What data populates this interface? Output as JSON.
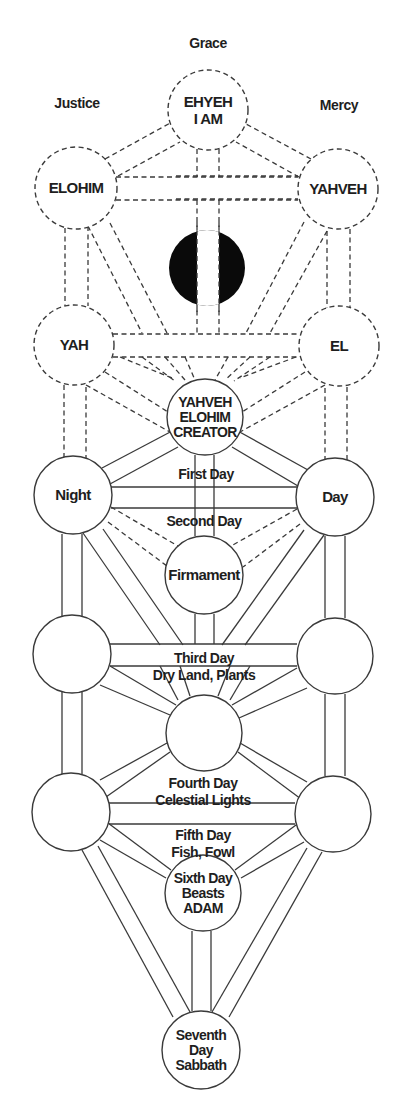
{
  "colors": {
    "background": "#ffffff",
    "stroke": "#3a3a3a",
    "text": "#1e1e1e",
    "daath_fill": "#0a0a0a"
  },
  "pillar_labels": [
    {
      "id": "grace",
      "text": "Grace",
      "x": 208,
      "y": 48
    },
    {
      "id": "justice",
      "text": "Justice",
      "x": 77,
      "y": 108
    },
    {
      "id": "mercy",
      "text": "Mercy",
      "x": 339,
      "y": 110
    }
  ],
  "nodes": [
    {
      "id": "ehyeh",
      "cx": 208,
      "cy": 110,
      "r": 40,
      "dashed": true,
      "lines": [
        "EHYEH",
        "I AM"
      ]
    },
    {
      "id": "elohim",
      "cx": 76,
      "cy": 188,
      "r": 41,
      "dashed": true,
      "lines": [
        "ELOHIM"
      ]
    },
    {
      "id": "yahveh",
      "cx": 338,
      "cy": 189,
      "r": 40,
      "dashed": true,
      "lines": [
        "YAHVEH"
      ]
    },
    {
      "id": "yah",
      "cx": 74,
      "cy": 345,
      "r": 40,
      "dashed": true,
      "lines": [
        "YAH"
      ]
    },
    {
      "id": "el",
      "cx": 339,
      "cy": 346,
      "r": 40,
      "dashed": true,
      "lines": [
        "EL"
      ]
    },
    {
      "id": "creator",
      "cx": 205,
      "cy": 417,
      "r": 38,
      "dashed": false,
      "lines": [
        "YAHVEH",
        "ELOHIM",
        "CREATOR"
      ]
    },
    {
      "id": "night",
      "cx": 73,
      "cy": 495,
      "r": 39,
      "dashed": false,
      "lines": [
        "Night"
      ]
    },
    {
      "id": "day",
      "cx": 335,
      "cy": 497,
      "r": 39,
      "dashed": false,
      "lines": [
        "Day"
      ]
    },
    {
      "id": "firmament",
      "cx": 204,
      "cy": 575,
      "r": 39,
      "dashed": false,
      "lines": [
        "Firmament"
      ]
    },
    {
      "id": "left-mid",
      "cx": 72,
      "cy": 654,
      "r": 39,
      "dashed": false,
      "lines": []
    },
    {
      "id": "right-mid",
      "cx": 335,
      "cy": 656,
      "r": 38,
      "dashed": false,
      "lines": []
    },
    {
      "id": "center",
      "cx": 204,
      "cy": 733,
      "r": 38,
      "dashed": false,
      "lines": []
    },
    {
      "id": "left-low",
      "cx": 71,
      "cy": 812,
      "r": 39,
      "dashed": false,
      "lines": []
    },
    {
      "id": "right-low",
      "cx": 333,
      "cy": 814,
      "r": 38,
      "dashed": false,
      "lines": []
    },
    {
      "id": "sixth-day",
      "cx": 203,
      "cy": 893,
      "r": 38,
      "dashed": false,
      "lines": [
        "Sixth Day",
        "Beasts",
        "ADAM"
      ]
    },
    {
      "id": "seventh-day",
      "cx": 201,
      "cy": 1050,
      "r": 39,
      "dashed": false,
      "lines": [
        "Seventh",
        "Day",
        "Sabbath"
      ]
    }
  ],
  "daath": {
    "cx": 207,
    "cy": 268,
    "r": 38,
    "gap_left": 197,
    "gap_right": 219
  },
  "path_labels": [
    {
      "id": "first-day",
      "lines": [
        "First Day"
      ],
      "x": 206,
      "y": 479
    },
    {
      "id": "second-day",
      "lines": [
        "Second Day"
      ],
      "x": 204,
      "y": 526
    },
    {
      "id": "third-day",
      "lines": [
        "Third Day",
        "Dry Land, Plants"
      ],
      "x": 204,
      "y": 663
    },
    {
      "id": "fourth-day",
      "lines": [
        "Fourth Day",
        "Celestial Lights"
      ],
      "x": 203,
      "y": 788
    },
    {
      "id": "fifth-day",
      "lines": [
        "Fifth Day",
        "Fish, Fowl"
      ],
      "x": 203,
      "y": 840
    }
  ],
  "dashed_lines": [
    [
      176,
      176,
      298,
      176
    ],
    [
      176,
      199,
      298,
      199
    ],
    [
      116,
      177,
      298,
      177
    ],
    [
      116,
      200,
      298,
      200
    ],
    [
      197,
      149,
      197,
      177
    ],
    [
      219,
      149,
      219,
      177
    ],
    [
      197,
      200,
      197,
      336
    ],
    [
      219,
      200,
      219,
      336
    ],
    [
      105,
      159,
      172,
      122
    ],
    [
      118,
      176,
      180,
      142
    ],
    [
      311,
      159,
      246,
      124
    ],
    [
      299,
      177,
      236,
      142
    ],
    [
      65,
      228,
      65,
      310
    ],
    [
      88,
      226,
      88,
      306
    ],
    [
      350,
      229,
      350,
      310
    ],
    [
      327,
      231,
      327,
      308
    ],
    [
      88,
      226,
      142,
      333
    ],
    [
      110,
      223,
      167,
      333
    ],
    [
      327,
      231,
      270,
      333
    ],
    [
      304,
      222,
      246,
      333
    ],
    [
      113,
      334,
      300,
      334
    ],
    [
      113,
      357,
      300,
      357
    ],
    [
      120,
      357,
      172,
      378
    ],
    [
      165,
      357,
      185,
      380
    ],
    [
      142,
      357,
      175,
      381
    ],
    [
      185,
      357,
      195,
      380
    ],
    [
      296,
      357,
      240,
      378
    ],
    [
      250,
      357,
      225,
      380
    ],
    [
      270,
      357,
      234,
      381
    ],
    [
      228,
      357,
      215,
      380
    ],
    [
      105,
      372,
      168,
      412
    ],
    [
      86,
      385,
      170,
      432
    ],
    [
      305,
      372,
      242,
      412
    ],
    [
      325,
      385,
      240,
      432
    ],
    [
      64,
      385,
      64,
      458
    ],
    [
      86,
      387,
      86,
      458
    ],
    [
      347,
      387,
      347,
      460
    ],
    [
      325,
      388,
      325,
      460
    ],
    [
      111,
      507,
      178,
      546
    ],
    [
      108,
      522,
      167,
      566
    ],
    [
      297,
      509,
      231,
      546
    ],
    [
      300,
      524,
      243,
      567
    ]
  ],
  "solid_lines": [
    [
      102,
      468,
      174,
      430
    ],
    [
      110,
      484,
      178,
      447
    ],
    [
      308,
      470,
      236,
      430
    ],
    [
      298,
      486,
      232,
      447
    ],
    [
      111,
      487,
      297,
      487
    ],
    [
      111,
      508,
      297,
      508
    ],
    [
      195,
      455,
      195,
      536
    ],
    [
      214,
      455,
      214,
      536
    ],
    [
      62,
      534,
      62,
      616
    ],
    [
      82,
      534,
      82,
      616
    ],
    [
      345,
      536,
      345,
      618
    ],
    [
      325,
      536,
      325,
      618
    ],
    [
      83,
      533,
      160,
      645
    ],
    [
      103,
      529,
      183,
      645
    ],
    [
      324,
      535,
      245,
      645
    ],
    [
      304,
      530,
      222,
      645
    ],
    [
      110,
      644,
      297,
      644
    ],
    [
      110,
      666,
      297,
      666
    ],
    [
      195,
      614,
      195,
      644
    ],
    [
      214,
      614,
      214,
      644
    ],
    [
      110,
      666,
      176,
      705
    ],
    [
      100,
      685,
      170,
      715
    ],
    [
      297,
      668,
      232,
      705
    ],
    [
      307,
      688,
      239,
      718
    ],
    [
      160,
      666,
      178,
      700
    ],
    [
      180,
      666,
      190,
      696
    ],
    [
      230,
      666,
      218,
      696
    ],
    [
      250,
      666,
      230,
      700
    ],
    [
      62,
      692,
      62,
      774
    ],
    [
      82,
      692,
      82,
      774
    ],
    [
      345,
      694,
      345,
      776
    ],
    [
      325,
      694,
      325,
      776
    ],
    [
      106,
      797,
      170,
      752
    ],
    [
      100,
      780,
      167,
      743
    ],
    [
      301,
      799,
      238,
      752
    ],
    [
      307,
      782,
      240,
      743
    ],
    [
      109,
      803,
      295,
      803
    ],
    [
      109,
      824,
      295,
      824
    ],
    [
      108,
      823,
      171,
      870
    ],
    [
      100,
      840,
      166,
      878
    ],
    [
      296,
      825,
      235,
      870
    ],
    [
      304,
      842,
      241,
      878
    ],
    [
      192,
      931,
      192,
      1011
    ],
    [
      211,
      931,
      211,
      1011
    ],
    [
      82,
      850,
      173,
      1017
    ],
    [
      98,
      846,
      190,
      1012
    ],
    [
      322,
      852,
      229,
      1017
    ],
    [
      307,
      848,
      212,
      1012
    ]
  ]
}
